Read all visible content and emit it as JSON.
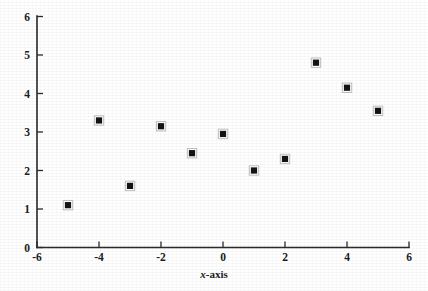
{
  "figure": {
    "kind": "scatter-plot",
    "background_color": "#ffffff",
    "ink_color": "#141414",
    "marker_symbol": "filled-square"
  },
  "chart_data": {
    "type": "scatter",
    "title": "",
    "subtitle": "",
    "xlabel": "x-axis",
    "xlabel_parts": {
      "variable": "x",
      "suffix": "-axis"
    },
    "ylabel": "",
    "xlim": [
      -6,
      6
    ],
    "ylim": [
      0,
      6
    ],
    "xticks": [
      -6,
      -4,
      -2,
      0,
      2,
      4,
      6
    ],
    "yticks": [
      0,
      1,
      2,
      3,
      4,
      5,
      6
    ],
    "xtick_labels": [
      "-6",
      "-4",
      "-2",
      "0",
      "2",
      "4",
      "6"
    ],
    "ytick_labels": [
      "0",
      "1",
      "2",
      "3",
      "4",
      "5",
      "6"
    ],
    "grid": false,
    "legend": null,
    "legend_position": "none",
    "series": [
      {
        "name": "data",
        "marker": "square",
        "color": "#141414",
        "x": [
          -5,
          -4,
          -3,
          -2,
          -1,
          0,
          1,
          2,
          3,
          4,
          5
        ],
        "y": [
          1.1,
          3.3,
          1.6,
          3.15,
          2.45,
          2.95,
          2.0,
          2.3,
          4.8,
          4.15,
          3.55
        ],
        "points": [
          {
            "x": -5,
            "y": 1.1
          },
          {
            "x": -4,
            "y": 3.3
          },
          {
            "x": -3,
            "y": 1.6
          },
          {
            "x": -2,
            "y": 3.15
          },
          {
            "x": -1,
            "y": 2.45
          },
          {
            "x": 0,
            "y": 2.95
          },
          {
            "x": 1,
            "y": 2.0
          },
          {
            "x": 2,
            "y": 2.3
          },
          {
            "x": 3,
            "y": 4.8
          },
          {
            "x": 4,
            "y": 4.15
          },
          {
            "x": 5,
            "y": 3.55
          }
        ]
      }
    ]
  }
}
